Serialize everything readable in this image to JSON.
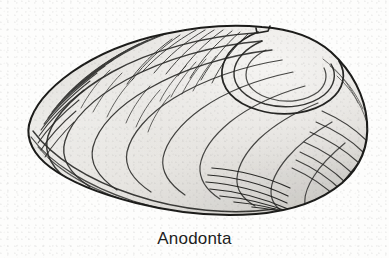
{
  "figure": {
    "caption": "Anodonta",
    "style": "black-and-white pen-and-ink scientific illustration, halftone shading",
    "background_color": "#fdfdfc",
    "ink_color": "#222222",
    "shell_fill_color": "#e9e8e5",
    "shell_shadow_color": "#b9b8b4"
  },
  "anatomy": {
    "umbo_label": "umbo",
    "growth_lines_label": "concentric growth lines",
    "ventral_margin_label": "ventral margin",
    "anterior_label": "anterior end",
    "posterior_label": "posterior end"
  }
}
